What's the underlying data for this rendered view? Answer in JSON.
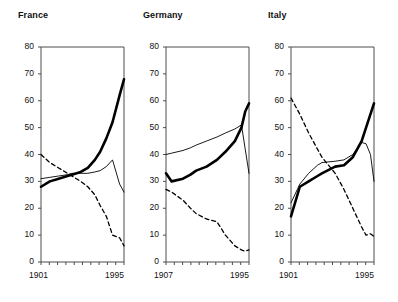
{
  "figure": {
    "background": "#ffffff",
    "panel_count": 3,
    "axis_color": "#4d4d4d",
    "series_colors": {
      "thick_solid": "#000000",
      "thin_solid": "#000000",
      "dashed": "#000000"
    }
  },
  "chart_data": [
    {
      "type": "line",
      "title": "France",
      "xlabel": "",
      "ylabel": "",
      "xlim": [
        1901,
        1995
      ],
      "ylim": [
        0,
        80
      ],
      "xticklabels": [
        "1901",
        "1995"
      ],
      "yticklabels": [
        "0",
        "10",
        "20",
        "30",
        "40",
        "50",
        "60",
        "70",
        "80"
      ],
      "ytickvalues": [
        0,
        10,
        20,
        30,
        40,
        50,
        60,
        70,
        80
      ],
      "grid": false,
      "legend": "none",
      "series": [
        {
          "name": "thick-solid",
          "style": "thick-solid",
          "x": [
            1901,
            1911,
            1921,
            1931,
            1936,
            1946,
            1954,
            1962,
            1968,
            1975,
            1982,
            1990,
            1995
          ],
          "values": [
            28,
            30,
            31,
            32,
            32.5,
            33.5,
            35,
            38,
            41,
            46,
            52,
            62,
            68
          ]
        },
        {
          "name": "thin-solid",
          "style": "thin-solid",
          "x": [
            1901,
            1911,
            1921,
            1931,
            1936,
            1946,
            1954,
            1962,
            1968,
            1975,
            1982,
            1990,
            1995
          ],
          "values": [
            31,
            31.5,
            32,
            32.5,
            33,
            33,
            33,
            33.5,
            34,
            35.5,
            38,
            29,
            26
          ]
        },
        {
          "name": "dashed",
          "style": "dashed",
          "x": [
            1901,
            1911,
            1921,
            1931,
            1936,
            1946,
            1954,
            1962,
            1968,
            1975,
            1982,
            1990,
            1995
          ],
          "values": [
            40,
            37,
            35,
            33,
            32,
            30,
            28,
            25,
            21,
            17,
            10,
            9,
            6
          ]
        }
      ]
    },
    {
      "type": "line",
      "title": "Germany",
      "xlabel": "",
      "ylabel": "",
      "xlim": [
        1907,
        1995
      ],
      "ylim": [
        0,
        80
      ],
      "xticklabels": [
        "1907",
        "1995"
      ],
      "yticklabels": [
        "0",
        "10",
        "20",
        "30",
        "40",
        "50",
        "60",
        "70",
        "80"
      ],
      "ytickvalues": [
        0,
        10,
        20,
        30,
        40,
        50,
        60,
        70,
        80
      ],
      "grid": false,
      "legend": "none",
      "series": [
        {
          "name": "thick-solid",
          "style": "thick-solid",
          "x": [
            1907,
            1913,
            1925,
            1933,
            1939,
            1950,
            1961,
            1970,
            1980,
            1987,
            1991,
            1995
          ],
          "values": [
            33,
            30,
            31,
            32.5,
            34,
            35.5,
            38,
            41,
            45,
            50,
            56,
            59
          ]
        },
        {
          "name": "thin-solid",
          "style": "thin-solid",
          "x": [
            1907,
            1913,
            1925,
            1933,
            1939,
            1950,
            1961,
            1970,
            1980,
            1987,
            1991,
            1995
          ],
          "values": [
            40,
            40.5,
            41.5,
            42.5,
            43.5,
            45,
            46.5,
            48,
            49.5,
            51,
            42,
            33
          ]
        },
        {
          "name": "dashed",
          "style": "dashed",
          "x": [
            1907,
            1913,
            1925,
            1933,
            1939,
            1950,
            1961,
            1970,
            1980,
            1987,
            1991,
            1995
          ],
          "values": [
            27,
            26,
            23,
            20,
            18,
            16,
            15,
            10,
            6,
            4.5,
            4,
            4.5
          ]
        }
      ]
    },
    {
      "type": "line",
      "title": "Italy",
      "xlabel": "",
      "ylabel": "",
      "xlim": [
        1901,
        1995
      ],
      "ylim": [
        0,
        80
      ],
      "xticklabels": [
        "1901",
        "1995"
      ],
      "yticklabels": [
        "0",
        "10",
        "20",
        "30",
        "40",
        "50",
        "60",
        "70",
        "80"
      ],
      "ytickvalues": [
        0,
        10,
        20,
        30,
        40,
        50,
        60,
        70,
        80
      ],
      "grid": false,
      "legend": "none",
      "series": [
        {
          "name": "thick-solid",
          "style": "thick-solid",
          "x": [
            1901,
            1911,
            1921,
            1931,
            1936,
            1951,
            1961,
            1971,
            1981,
            1986,
            1991,
            1995
          ],
          "values": [
            17,
            28,
            30,
            32,
            33,
            35.5,
            36,
            39,
            45,
            50,
            55,
            59
          ]
        },
        {
          "name": "thin-solid",
          "style": "thin-solid",
          "x": [
            1901,
            1911,
            1921,
            1931,
            1936,
            1951,
            1961,
            1971,
            1981,
            1986,
            1991,
            1995
          ],
          "values": [
            22,
            29,
            33,
            36,
            37,
            37.5,
            38,
            40,
            44.5,
            44,
            40,
            30
          ]
        },
        {
          "name": "dashed",
          "style": "dashed",
          "x": [
            1901,
            1911,
            1921,
            1931,
            1936,
            1951,
            1961,
            1971,
            1981,
            1986,
            1991,
            1995
          ],
          "values": [
            61,
            55,
            48,
            42,
            39,
            33,
            27,
            20,
            13,
            10,
            10.5,
            9.5
          ]
        }
      ]
    }
  ]
}
